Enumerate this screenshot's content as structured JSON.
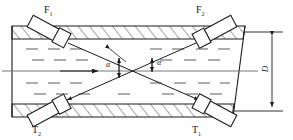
{
  "figure": {
    "type": "engineering-diagram",
    "stroke_color": "#1b1b1b",
    "fill_color": "#ffffff",
    "background": "#fefefe",
    "hatch_color": "#3a3a3a"
  },
  "labels": {
    "transducer_top_left": {
      "base": "F",
      "sub": "1"
    },
    "transducer_top_right": {
      "base": "F",
      "sub": "2"
    },
    "transducer_bottom_left": {
      "base": "T",
      "sub": "2"
    },
    "transducer_bottom_right": {
      "base": "T",
      "sub": "1"
    },
    "angle_left": "α",
    "angle_right": "α",
    "diameter": "D"
  },
  "geometry": {
    "pipe_left_x": 12,
    "pipe_wall_top_outer_y": 26,
    "pipe_wall_top_inner_y": 39,
    "pipe_wall_bottom_inner_y": 104,
    "pipe_wall_bottom_outer_y": 117,
    "pipe_break_top_x": 243,
    "pipe_break_bottom_x": 232,
    "centerline_y": 71,
    "dimension_line_x": 272,
    "crossing_point": {
      "x": 133,
      "y": 71
    },
    "angle_degrees_label": "α"
  },
  "flow": {
    "arrow_direction": "left-to-right",
    "centerline_arrow_x": 92,
    "fluid_marks": "short-dashes"
  },
  "paths": [
    {
      "name": "signal-path-F1-to-T1",
      "from": "F1",
      "to": "T1"
    },
    {
      "name": "signal-path-F2-to-T2",
      "from": "F2",
      "to": "T2"
    }
  ]
}
